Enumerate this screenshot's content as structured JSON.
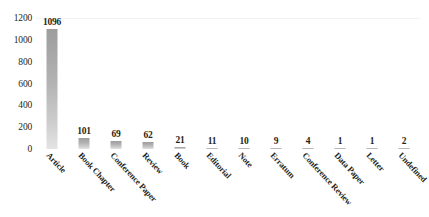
{
  "chart_data": {
    "type": "bar",
    "title": "",
    "subtitle": "",
    "xlabel": "",
    "ylabel": "",
    "ylim": [
      0,
      1200
    ],
    "yticks": [
      0,
      200,
      400,
      600,
      800,
      1000,
      1200
    ],
    "ytick_labels": [
      "0",
      "200",
      "400",
      "600",
      "800",
      "1000",
      "1200"
    ],
    "grid": false,
    "legend": null,
    "legend_position": "none",
    "bar_color": "#b3b3b3",
    "label_color": "#231f20",
    "categories": [
      "Article",
      "Book Chapter",
      "Conference Paper",
      "Review",
      "Book",
      "Editorial",
      "Note",
      "Erratum",
      "Conference Review",
      "Data Paper",
      "Letter",
      "Undefined"
    ],
    "values": [
      1096,
      101,
      69,
      62,
      21,
      11,
      10,
      9,
      4,
      1,
      1,
      2
    ],
    "value_labels": [
      "1096",
      "101",
      "69",
      "62",
      "21",
      "11",
      "10",
      "9",
      "4",
      "1",
      "1",
      "2"
    ]
  }
}
